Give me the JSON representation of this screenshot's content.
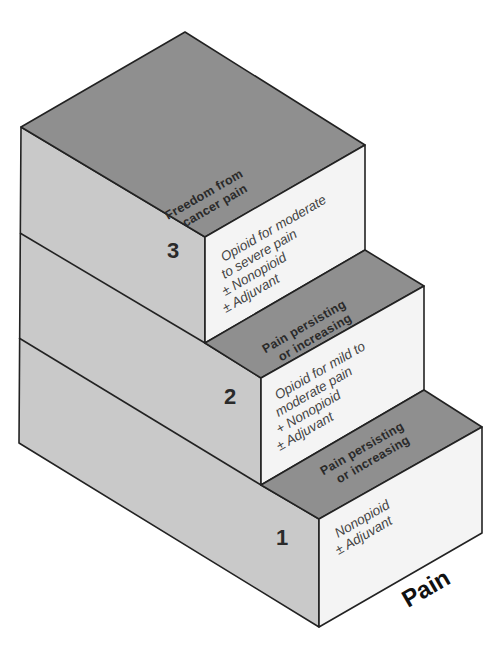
{
  "diagram": {
    "axis_label": "Pain",
    "goal": {
      "line1": "Freedom from",
      "line2": "cancer pain"
    },
    "steps": [
      {
        "number": "1",
        "treatment": [
          "Nonopioid",
          "± Adjuvant"
        ],
        "transition": [
          "Pain persisting",
          "or increasing"
        ]
      },
      {
        "number": "2",
        "treatment": [
          "Opioid for mild to",
          "moderate pain",
          "+ Nonopioid",
          "± Adjuvant"
        ],
        "transition": [
          "Pain persisting",
          "or increasing"
        ]
      },
      {
        "number": "3",
        "treatment": [
          "Opioid for moderate",
          "to severe pain",
          "± Nonopioid",
          "± Adjuvant"
        ]
      }
    ],
    "colors": {
      "top_face": "#8f8f8f",
      "side_face": "#c9c9c9",
      "front_face": "#f4f4f4",
      "outline": "#222222"
    }
  }
}
